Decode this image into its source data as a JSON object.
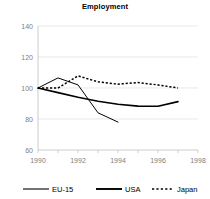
{
  "chart_data": {
    "type": "line",
    "title": "Employment",
    "xlabel": "",
    "ylabel": "",
    "ylim": [
      60,
      140
    ],
    "xlim": [
      1990,
      1998
    ],
    "ytick_values": [
      60,
      80,
      100,
      120,
      140
    ],
    "ytick_labels": [
      "60",
      "80",
      "100",
      "120",
      "140"
    ],
    "xtick_values": [
      1990,
      1992,
      1994,
      1996,
      1998
    ],
    "xtick_labels": [
      "1990",
      "1992",
      "1994",
      "1996",
      "1998"
    ],
    "grid": true,
    "grid_axis": "y",
    "legend_position": "bottom",
    "series": [
      {
        "name": "EU-15",
        "style": "solid-thin",
        "color": "#000000",
        "x": [
          1990,
          1991,
          1992,
          1993,
          1994
        ],
        "values": [
          100.0,
          106.5,
          102.0,
          84.0,
          78.0
        ]
      },
      {
        "name": "USA",
        "style": "solid-thick",
        "color": "#000000",
        "x": [
          1990,
          1991,
          1992,
          1993,
          1994,
          1995,
          1996,
          1997
        ],
        "values": [
          100.0,
          97.0,
          94.0,
          91.5,
          89.5,
          88.3,
          88.2,
          91.2
        ]
      },
      {
        "name": "Japan",
        "style": "dotted",
        "color": "#000000",
        "x": [
          1990,
          1991,
          1992,
          1993,
          1994,
          1995,
          1996,
          1997
        ],
        "values": [
          100.0,
          100.0,
          107.8,
          104.0,
          102.5,
          103.5,
          102.0,
          100.0
        ]
      }
    ]
  },
  "chart": {
    "title": "Employment"
  },
  "axes": {
    "y_labels": [
      "140",
      "120",
      "100",
      "80",
      "60"
    ],
    "x_labels": [
      "1990",
      "1992",
      "1994",
      "1996",
      "1998"
    ]
  },
  "legend": {
    "items": [
      {
        "label": "EU-15"
      },
      {
        "label": "USA"
      },
      {
        "label": "Japan"
      }
    ]
  }
}
